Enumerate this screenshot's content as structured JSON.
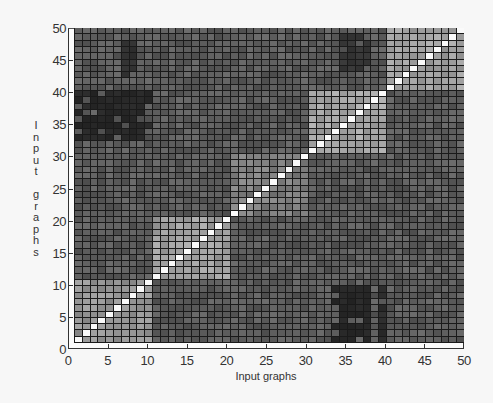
{
  "chart_data": {
    "type": "heatmap",
    "title": "",
    "xlabel": "Input graphs",
    "ylabel": "Input graphs",
    "xlim": [
      0,
      50
    ],
    "ylim": [
      0,
      50
    ],
    "x_ticks": [
      0,
      5,
      10,
      15,
      20,
      25,
      30,
      35,
      40,
      45,
      50
    ],
    "y_ticks": [
      0,
      5,
      10,
      15,
      20,
      25,
      30,
      35,
      40,
      45,
      50
    ],
    "grid": true,
    "colormap": "gray",
    "n": 50,
    "diagonal_value": 1.0,
    "background_value": 0.3,
    "blocks": [
      {
        "rows": [
          1,
          10
        ],
        "cols": [
          1,
          10
        ],
        "value": 0.55,
        "label": "cluster 1"
      },
      {
        "rows": [
          11,
          20
        ],
        "cols": [
          11,
          20
        ],
        "value": 0.6,
        "label": "cluster 2"
      },
      {
        "rows": [
          21,
          30
        ],
        "cols": [
          21,
          30
        ],
        "value": 0.45,
        "label": "cluster 3"
      },
      {
        "rows": [
          31,
          40
        ],
        "cols": [
          31,
          40
        ],
        "value": 0.62,
        "label": "cluster 4"
      },
      {
        "rows": [
          41,
          50
        ],
        "cols": [
          41,
          50
        ],
        "value": 0.6,
        "label": "cluster 5"
      }
    ],
    "dark_regions": [
      {
        "rows": [
          33,
          40
        ],
        "cols": [
          1,
          10
        ],
        "value": 0.04
      },
      {
        "rows": [
          1,
          9
        ],
        "cols": [
          34,
          38
        ],
        "value": 0.04
      },
      {
        "rows": [
          1,
          9
        ],
        "cols": [
          40,
          40
        ],
        "value": 0.06
      },
      {
        "rows": [
          44,
          49
        ],
        "cols": [
          35,
          38
        ],
        "value": 0.1
      },
      {
        "rows": [
          43,
          48
        ],
        "cols": [
          7,
          8
        ],
        "value": 0.08
      }
    ]
  },
  "axes": {
    "xlabel": "Input graphs",
    "ylabel_letters": [
      "I",
      "n",
      "p",
      "u",
      "t",
      "",
      "g",
      "r",
      "a",
      "p",
      "h",
      "s"
    ],
    "x_tick_labels": [
      "0",
      "5",
      "10",
      "15",
      "20",
      "25",
      "30",
      "35",
      "40",
      "45",
      "50"
    ],
    "y_tick_labels": [
      "0",
      "5",
      "10",
      "15",
      "20",
      "25",
      "30",
      "35",
      "40",
      "45",
      "50"
    ]
  }
}
